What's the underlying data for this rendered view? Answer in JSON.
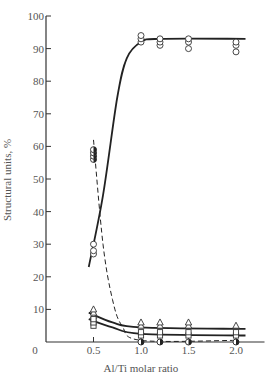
{
  "chart_data": {
    "type": "scatter",
    "title": "",
    "xlabel": "Al/Ti molar ratio",
    "ylabel": "Structural units, %",
    "xlim": [
      0,
      2.3
    ],
    "ylim": [
      0,
      100
    ],
    "x_ticks": [
      "0",
      "0.5",
      "1.0",
      "1.5",
      "2.0"
    ],
    "y_ticks": [
      "10",
      "20",
      "30",
      "40",
      "50",
      "60",
      "70",
      "80",
      "90",
      "100"
    ],
    "grid": false,
    "legend": null,
    "series": [
      {
        "name": "open circles (rising to plateau)",
        "marker": "open-circle",
        "line": "solid",
        "points": [
          [
            0.5,
            27
          ],
          [
            0.5,
            28
          ],
          [
            0.5,
            30
          ],
          [
            1.0,
            92
          ],
          [
            1.0,
            93
          ],
          [
            1.0,
            94
          ],
          [
            1.2,
            91
          ],
          [
            1.2,
            92
          ],
          [
            1.2,
            93
          ],
          [
            1.5,
            90
          ],
          [
            1.5,
            92
          ],
          [
            1.5,
            93
          ],
          [
            2.0,
            89
          ],
          [
            2.0,
            91
          ],
          [
            2.0,
            92
          ]
        ],
        "curve": [
          [
            0.45,
            23
          ],
          [
            0.6,
            45
          ],
          [
            0.75,
            75
          ],
          [
            0.85,
            87
          ],
          [
            1.0,
            92
          ],
          [
            1.2,
            93
          ],
          [
            2.1,
            93
          ]
        ]
      },
      {
        "name": "half-filled circles (decaying, dashed)",
        "marker": "half-filled-circle",
        "line": "dashed",
        "points": [
          [
            0.5,
            56
          ],
          [
            0.5,
            57
          ],
          [
            0.5,
            58
          ],
          [
            0.5,
            59
          ],
          [
            1.0,
            0
          ],
          [
            1.2,
            0
          ],
          [
            1.5,
            0
          ],
          [
            2.0,
            0
          ]
        ],
        "curve": [
          [
            0.5,
            62
          ],
          [
            0.6,
            30
          ],
          [
            0.7,
            13
          ],
          [
            0.8,
            5
          ],
          [
            1.0,
            0.5
          ],
          [
            2.0,
            0.5
          ]
        ]
      },
      {
        "name": "triangles (upper low curve)",
        "marker": "open-triangle",
        "line": "solid",
        "points": [
          [
            0.5,
            8
          ],
          [
            0.5,
            9
          ],
          [
            0.5,
            10
          ],
          [
            1.0,
            5
          ],
          [
            1.0,
            6
          ],
          [
            1.2,
            5
          ],
          [
            1.2,
            6
          ],
          [
            1.5,
            5
          ],
          [
            1.5,
            6
          ],
          [
            2.0,
            5
          ]
        ],
        "curve": [
          [
            0.45,
            9
          ],
          [
            0.7,
            6
          ],
          [
            1.0,
            4.5
          ],
          [
            2.1,
            4
          ]
        ]
      },
      {
        "name": "squares (lower low curve)",
        "marker": "open-square",
        "line": "solid",
        "points": [
          [
            0.5,
            5
          ],
          [
            0.5,
            6
          ],
          [
            0.5,
            7
          ],
          [
            1.0,
            2
          ],
          [
            1.0,
            3
          ],
          [
            1.2,
            2
          ],
          [
            1.2,
            3
          ],
          [
            1.5,
            2
          ],
          [
            1.5,
            3
          ],
          [
            2.0,
            2
          ],
          [
            2.0,
            3
          ]
        ],
        "curve": [
          [
            0.45,
            7
          ],
          [
            0.7,
            4.5
          ],
          [
            1.0,
            2.5
          ],
          [
            2.1,
            2
          ]
        ]
      }
    ]
  },
  "axes": {
    "x_title": "Al/Ti molar ratio",
    "y_title": "Structural units, %",
    "origin_label": "0"
  }
}
